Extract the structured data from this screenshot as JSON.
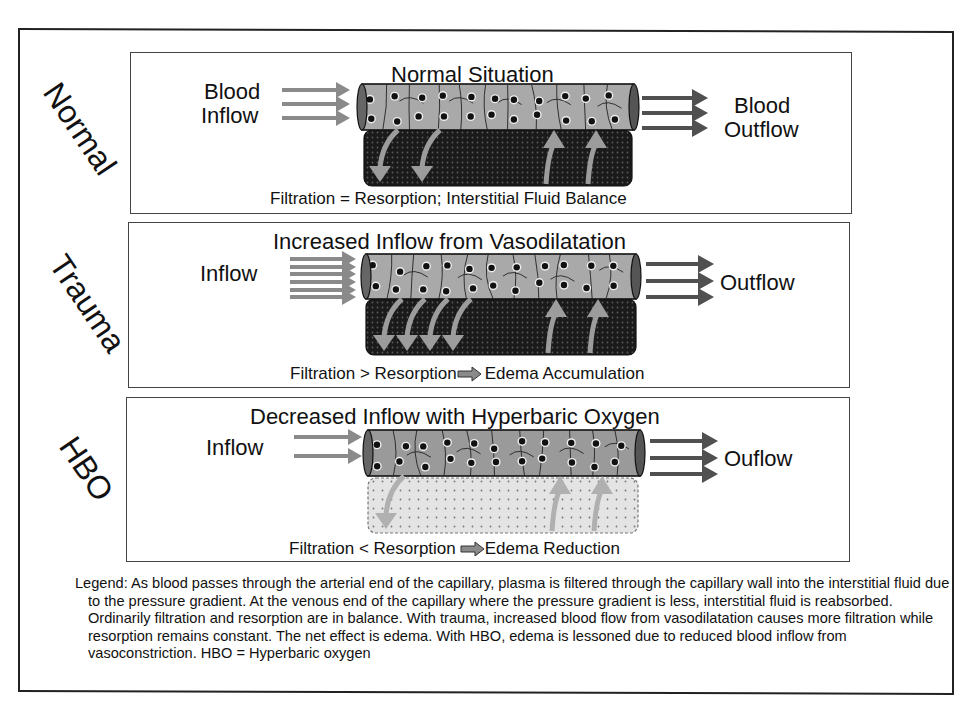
{
  "colors": {
    "frame": "#222222",
    "vessel_fill": "#a9a9a9",
    "vessel_fill_hbo": "#9a9a9a",
    "tissue_dark": "#1a1a1a",
    "tissue_light": "#e4e4e4",
    "arrow_in": "#8a8a8a",
    "arrow_out": "#505050",
    "fluid_arrow": "#9c9c9c"
  },
  "rows": [
    {
      "side_label": "Normal",
      "title": "Normal Situation",
      "inflow_label": [
        "Blood",
        "Inflow"
      ],
      "outflow_label": [
        "Blood",
        "Outflow"
      ],
      "inflow_arrows": 3,
      "outflow_arrows": 3,
      "filtration_arrows": 2,
      "resorption_arrows": 2,
      "tissue_state": "dark",
      "caption": "Filtration = Resorption; Interstitial Fluid Balance",
      "caption_parts": [
        "Filtration = Resorption; Interstitial Fluid Balance"
      ]
    },
    {
      "side_label": "Trauma",
      "title": "Increased Inflow from Vasodilatation",
      "inflow_label": [
        "Inflow"
      ],
      "outflow_label": [
        "Outflow"
      ],
      "inflow_arrows": 6,
      "outflow_arrows": 3,
      "filtration_arrows": 4,
      "resorption_arrows": 2,
      "tissue_state": "dark",
      "caption_parts": [
        "Filtration > Resorption",
        "Edema Accumulation"
      ]
    },
    {
      "side_label": "HBO",
      "title": "Decreased Inflow with Hyperbaric Oxygen",
      "inflow_label": [
        "Inflow"
      ],
      "outflow_label": [
        "Ouflow"
      ],
      "inflow_arrows": 2,
      "outflow_arrows": 3,
      "filtration_arrows": 1,
      "resorption_arrows": 2,
      "tissue_state": "light",
      "caption_parts": [
        "Filtration < Resorption",
        "Edema Reduction"
      ]
    }
  ],
  "legend": {
    "lead": "Legend:",
    "text": " As blood passes through the arterial end of the capillary, plasma is filtered through the capillary wall into the interstitial fluid due to the pressure gradient.  At the venous end of the capillary where the pressure gradient is less, interstitial fluid is reabsorbed. Ordinarily filtration and resorption are in balance.  With trauma, increased blood flow from vasodilatation causes more filtration while resorption  remains constant. The net effect is edema. With HBO, edema is lessoned due to reduced blood inflow from vasoconstriction.  ",
    "abbrev": "HBO = ",
    "abbrev_rest": "Hyperbaric oxygen"
  }
}
